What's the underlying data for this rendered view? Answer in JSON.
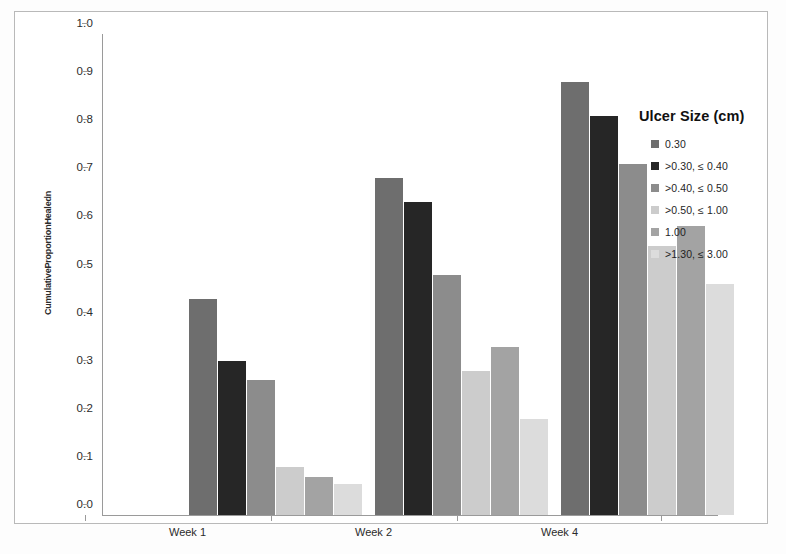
{
  "chart_data": {
    "type": "bar",
    "title": "",
    "xlabel": "",
    "ylabel": "CumulativeProportionHealedn",
    "ylim": [
      0.0,
      1.0
    ],
    "ytick_labels": [
      "1.0",
      "0.9",
      "0.8",
      "0.7",
      "0.6",
      "0.5",
      "0.4",
      "0.3",
      "0.2",
      "0.1",
      "0.0"
    ],
    "ytick_values": [
      1.0,
      0.9,
      0.8,
      0.7,
      0.6,
      0.5,
      0.4,
      0.3,
      0.2,
      0.1,
      0.0
    ],
    "categories": [
      "Week 1",
      "Week 2",
      "Week 4"
    ],
    "grid": false,
    "legend_position": "right",
    "legend_title": "Ulcer Size (cm)",
    "series": [
      {
        "name": "0.30",
        "color": "#6e6e6e",
        "values": [
          0.45,
          0.7,
          0.9
        ]
      },
      {
        "name": ">0.30, ≤ 0.40",
        "color": "#262626",
        "values": [
          0.32,
          0.65,
          0.83
        ]
      },
      {
        "name": ">0.40, ≤ 0.50",
        "color": "#8c8c8c",
        "values": [
          0.28,
          0.5,
          0.73
        ]
      },
      {
        "name": ">0.50, ≤ 1.00",
        "color": "#cccccc",
        "values": [
          0.1,
          0.3,
          0.56
        ]
      },
      {
        "name": "1.00",
        "color": "#a3a3a3",
        "values": [
          0.08,
          0.35,
          0.6
        ]
      },
      {
        "name": ">1.30, ≤ 3.00",
        "color": "#dcdcdc",
        "values": [
          0.065,
          0.2,
          0.48
        ]
      }
    ]
  },
  "figure": {
    "border_color": "#b9b9b9",
    "axis_color": "#9a9a9a",
    "background": "#ffffff"
  }
}
